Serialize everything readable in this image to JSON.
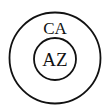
{
  "diagram": {
    "type": "nested-set (Euler) diagram",
    "outer_set": {
      "label": "CA",
      "stroke": "#111111"
    },
    "inner_set": {
      "label": "AZ",
      "stroke": "#111111"
    }
  }
}
